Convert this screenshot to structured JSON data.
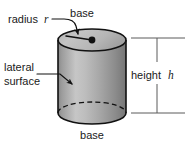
{
  "figure": {
    "kind": "geometry-diagram",
    "shape": "right circular cylinder",
    "background_color": "#ffffff",
    "outline_color": "#111111",
    "text_color": "#1a1a1a",
    "dimension_line_color": "#5a5a5a"
  },
  "labels": {
    "radius": {
      "text": "radius",
      "variable": "r",
      "position": "top-left",
      "points_to": "top base ellipse"
    },
    "base_top": {
      "text": "base",
      "position": "top-center",
      "points_to": "top base"
    },
    "lateral_surface": {
      "line1": "lateral",
      "line2": "surface",
      "position": "middle-left",
      "points_to": "curved side wall"
    },
    "height": {
      "text": "height",
      "variable": "h",
      "position": "middle-right",
      "points_to": "vertical extent of cylinder"
    },
    "base_bottom": {
      "text": "base",
      "position": "bottom-center",
      "points_to": "bottom base"
    }
  },
  "geometry": {
    "cylinder": {
      "center_x": 92,
      "top_ellipse_center_y": 40,
      "bottom_ellipse_center_y": 113,
      "radius_x": 34,
      "radius_y": 11,
      "body_height": 73
    },
    "center_dot": {
      "x": 92,
      "y": 40
    },
    "radius_segment": {
      "from_x": 92,
      "from_y": 40,
      "to_x": 66,
      "to_y": 36
    },
    "dimension": {
      "top_tick_y": 38,
      "bottom_tick_y": 113,
      "vertical_x": 157,
      "tick_left_x": 130,
      "tick_right_x": 185
    }
  },
  "colors": {
    "body_gradient": [
      "#8e8e8e",
      "#c9c9c9",
      "#a9a9a9",
      "#7b7b7b"
    ],
    "top_face": "#b8b8b8",
    "bottom_face": "#9a9a9a",
    "outline": "#111111"
  }
}
